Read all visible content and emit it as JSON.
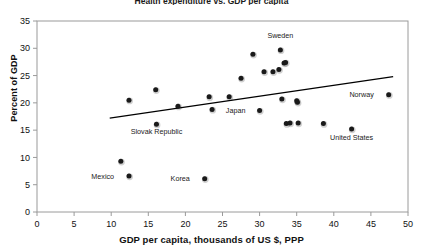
{
  "chart_data": {
    "type": "scatter",
    "title": "Health expenditure vs. GDP per capita",
    "xlabel": "GDP per capita, thousands of US $, PPP",
    "ylabel": "Percent of GDP",
    "xlim": [
      0,
      50
    ],
    "ylim": [
      0,
      35
    ],
    "xticks": [
      0,
      5,
      10,
      15,
      20,
      25,
      30,
      35,
      40,
      45,
      50
    ],
    "yticks": [
      0,
      5,
      10,
      15,
      20,
      25,
      30,
      35
    ],
    "xtick_labels": [
      "0",
      "5",
      "10",
      "15",
      "20",
      "25",
      "30",
      "35",
      "40",
      "45",
      "50"
    ],
    "ytick_labels": [
      "0",
      "5",
      "10",
      "15",
      "20",
      "25",
      "30",
      "35"
    ],
    "grid": false,
    "legend": "none",
    "marker_color": "#1a1a1a",
    "trendline_color": "#000000",
    "axis_color": "#9a9a9a",
    "points": [
      {
        "x": 11.3,
        "y": 9.3,
        "label": ""
      },
      {
        "x": 12.4,
        "y": 20.5,
        "label": ""
      },
      {
        "x": 12.4,
        "y": 6.6,
        "label": "Mexico"
      },
      {
        "x": 16.0,
        "y": 22.4,
        "label": ""
      },
      {
        "x": 16.1,
        "y": 16.1,
        "label": "Slovak Republic"
      },
      {
        "x": 19.0,
        "y": 19.4,
        "label": ""
      },
      {
        "x": 22.6,
        "y": 6.1,
        "label": "Korea"
      },
      {
        "x": 23.2,
        "y": 21.1,
        "label": ""
      },
      {
        "x": 23.6,
        "y": 18.8,
        "label": ""
      },
      {
        "x": 25.9,
        "y": 21.1,
        "label": ""
      },
      {
        "x": 27.5,
        "y": 24.5,
        "label": ""
      },
      {
        "x": 29.1,
        "y": 28.9,
        "label": ""
      },
      {
        "x": 30.0,
        "y": 18.6,
        "label": "Japan"
      },
      {
        "x": 30.6,
        "y": 25.7,
        "label": ""
      },
      {
        "x": 31.8,
        "y": 25.7,
        "label": ""
      },
      {
        "x": 32.6,
        "y": 26.1,
        "label": ""
      },
      {
        "x": 32.8,
        "y": 29.7,
        "label": "Sweden"
      },
      {
        "x": 33.3,
        "y": 27.3,
        "label": ""
      },
      {
        "x": 33.5,
        "y": 27.4,
        "label": ""
      },
      {
        "x": 33.6,
        "y": 16.2,
        "label": ""
      },
      {
        "x": 34.1,
        "y": 16.3,
        "label": ""
      },
      {
        "x": 33.0,
        "y": 20.7,
        "label": ""
      },
      {
        "x": 35.0,
        "y": 20.4,
        "label": ""
      },
      {
        "x": 35.1,
        "y": 20.1,
        "label": ""
      },
      {
        "x": 35.2,
        "y": 16.3,
        "label": ""
      },
      {
        "x": 38.6,
        "y": 16.2,
        "label": ""
      },
      {
        "x": 42.4,
        "y": 15.2,
        "label": "United States"
      },
      {
        "x": 47.4,
        "y": 21.5,
        "label": "Norway"
      }
    ],
    "trendline": {
      "x0": 9.8,
      "y0": 17.2,
      "x1": 48.0,
      "y1": 24.8
    },
    "annotations": [
      {
        "text": "Sweden",
        "x": 32.8,
        "y": 31.9,
        "anchor": "middle"
      },
      {
        "text": "Slovak Republic",
        "x": 16.1,
        "y": 14.3,
        "anchor": "middle"
      },
      {
        "text": "Mexico",
        "x": 11.2,
        "y": 6.6,
        "anchor": "end"
      },
      {
        "text": "Korea",
        "x": 21.4,
        "y": 6.1,
        "anchor": "end"
      },
      {
        "text": "Japan",
        "x": 28.9,
        "y": 18.6,
        "anchor": "end"
      },
      {
        "text": "United States",
        "x": 42.4,
        "y": 13.2,
        "anchor": "middle"
      },
      {
        "text": "Norway",
        "x": 46.2,
        "y": 21.5,
        "anchor": "end"
      }
    ]
  }
}
